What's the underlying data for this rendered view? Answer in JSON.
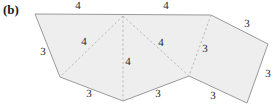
{
  "figure": {
    "panel_label": "(b)",
    "width": 277,
    "height": 109,
    "background_color": "#ffffff",
    "face_fill_color": "#eeeeee",
    "outline_color": "#9a9a9a",
    "fold_line_color": "#b9b9b9",
    "label_color": "#2b2b2b"
  },
  "chart_data": {
    "type": "diagram",
    "title": "(b)",
    "outline_points": "35,14 211,15 268,44 247,103 189,76 123,101 60,77",
    "fold_lines": [
      {
        "name": "fold-apex-to-left-bottom",
        "x1": 123,
        "y1": 16,
        "x2": 60,
        "y2": 77
      },
      {
        "name": "fold-apex-to-bottom-apex",
        "x1": 123,
        "y1": 16,
        "x2": 123,
        "y2": 101
      },
      {
        "name": "fold-apex-to-notch",
        "x1": 123,
        "y1": 16,
        "x2": 189,
        "y2": 76
      },
      {
        "name": "fold-topright-to-notch",
        "x1": 211,
        "y1": 15,
        "x2": 189,
        "y2": 76
      }
    ],
    "vertices": [
      {
        "name": "top-left",
        "x": 35,
        "y": 14
      },
      {
        "name": "top-right",
        "x": 211,
        "y": 15
      },
      {
        "name": "far-right",
        "x": 268,
        "y": 44
      },
      {
        "name": "bottom-right",
        "x": 247,
        "y": 103
      },
      {
        "name": "notch",
        "x": 189,
        "y": 76
      },
      {
        "name": "bottom-apex",
        "x": 123,
        "y": 101
      },
      {
        "name": "left-bottom",
        "x": 60,
        "y": 77
      },
      {
        "name": "top-center-apex",
        "x": 123,
        "y": 16
      }
    ],
    "edge_labels": [
      {
        "name": "top-left-edge-length",
        "value": "4",
        "x": 78,
        "y": 6
      },
      {
        "name": "top-right-edge-length",
        "value": "4",
        "x": 166,
        "y": 6
      },
      {
        "name": "left-slant-edge-length",
        "value": "3",
        "x": 43,
        "y": 52
      },
      {
        "name": "fold-left-length",
        "value": "4",
        "x": 84,
        "y": 42
      },
      {
        "name": "fold-center-length",
        "value": "4",
        "x": 128,
        "y": 62
      },
      {
        "name": "fold-right-length",
        "value": "4",
        "x": 161,
        "y": 43
      },
      {
        "name": "fold-far-right-length",
        "value": "3",
        "x": 205,
        "y": 49
      },
      {
        "name": "upper-right-edge-length",
        "value": "3",
        "x": 247,
        "y": 24
      },
      {
        "name": "right-edge-length",
        "value": "3",
        "x": 268,
        "y": 74
      },
      {
        "name": "bottom-left-edge-length",
        "value": "3",
        "x": 89,
        "y": 94
      },
      {
        "name": "bottom-center-edge-length",
        "value": "3",
        "x": 158,
        "y": 94
      },
      {
        "name": "bottom-right-edge-length",
        "value": "3",
        "x": 213,
        "y": 96
      }
    ],
    "legend": null,
    "grid": false
  }
}
